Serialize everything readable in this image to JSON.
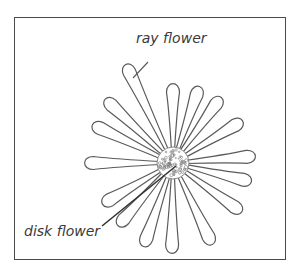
{
  "diagram": {
    "labels": {
      "ray": "ray flower",
      "disk": "disk flower"
    },
    "colors": {
      "stroke": "#5a5a5a",
      "frame": "#4a4a4a",
      "text": "#3a3a3a",
      "leader_disk": "#333333"
    },
    "center": [
      173,
      163
    ],
    "disk_radius": 16,
    "petal_tips": [
      [
        125,
        63
      ],
      [
        173,
        82
      ],
      [
        200,
        85
      ],
      [
        222,
        96
      ],
      [
        244,
        120
      ],
      [
        257,
        156
      ],
      [
        253,
        182
      ],
      [
        243,
        213
      ],
      [
        213,
        246
      ],
      [
        172,
        255
      ],
      [
        143,
        248
      ],
      [
        117,
        227
      ],
      [
        101,
        205
      ],
      [
        83,
        163
      ],
      [
        91,
        124
      ],
      [
        104,
        98
      ]
    ],
    "petal_width": 13,
    "leaders": {
      "ray": [
        [
          133,
          78
        ],
        [
          148,
          62
        ]
      ],
      "disk": [
        [
          102,
          226
        ],
        [
          176,
          166
        ]
      ]
    }
  }
}
